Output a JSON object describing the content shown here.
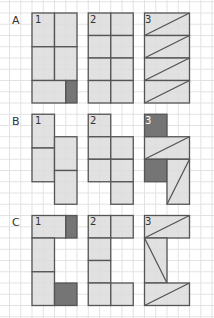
{
  "colors": {
    "grid": "#e3e3e3",
    "fill": "#dcdcdc",
    "dark": "#6e6e6e",
    "stroke": "#555555"
  },
  "rows": [
    {
      "label": "A",
      "panels": [
        {
          "num": "1"
        },
        {
          "num": "2"
        },
        {
          "num": "3"
        }
      ]
    },
    {
      "label": "B",
      "panels": [
        {
          "num": "1"
        },
        {
          "num": "2"
        },
        {
          "num": "3"
        }
      ]
    },
    {
      "label": "C",
      "panels": [
        {
          "num": "1"
        },
        {
          "num": "2"
        },
        {
          "num": "3"
        }
      ]
    }
  ]
}
